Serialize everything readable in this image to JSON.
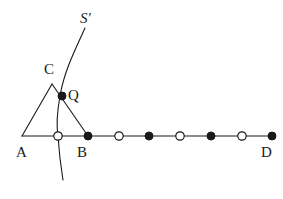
{
  "figure": {
    "type": "geometry-diagram",
    "width": 283,
    "height": 199,
    "background_color": "#ffffff",
    "stroke_color": "#1a1a1a",
    "marker_fill_color": "#1a1a1a",
    "marker_hollow_color": "#ffffff",
    "labels": {
      "A": "A",
      "B": "B",
      "C": "C",
      "D": "D",
      "Q": "Q",
      "S_prime": "S′"
    },
    "label_positions": {
      "A": {
        "x": 16,
        "y": 145
      },
      "B": {
        "x": 77,
        "y": 145
      },
      "C": {
        "x": 44,
        "y": 62
      },
      "D": {
        "x": 261,
        "y": 145
      },
      "Q": {
        "x": 68,
        "y": 88
      },
      "S_prime": {
        "x": 80,
        "y": 11
      }
    },
    "points": {
      "A": {
        "x": 22,
        "y": 136
      },
      "B": {
        "x": 88,
        "y": 136
      },
      "C": {
        "x": 52,
        "y": 84
      },
      "D": {
        "x": 272,
        "y": 136
      },
      "Q": {
        "x": 62,
        "y": 96
      }
    },
    "baseline": {
      "name": "segment-AD",
      "x1": 22,
      "y1": 136,
      "x2": 272,
      "y2": 136
    },
    "triangle": {
      "name": "triangle-ABC",
      "vertices": [
        {
          "x": 22,
          "y": 136
        },
        {
          "x": 52,
          "y": 84
        },
        {
          "x": 88,
          "y": 136
        }
      ],
      "edges": [
        "A-C",
        "C-B",
        "A-B"
      ]
    },
    "curve": {
      "name": "curve-S-prime",
      "path": "M 85,28 C 74,52 64,72 60,96 C 56,118 57,130 58,136 C 59,152 61,168 63,180",
      "top_end": {
        "x": 85,
        "y": 28
      },
      "bottom_end": {
        "x": 63,
        "y": 180
      }
    },
    "markers": [
      {
        "index": 0,
        "x": 58,
        "y": 136,
        "style": "hollow",
        "radius": 4.2,
        "label": ""
      },
      {
        "index": 1,
        "x": 88,
        "y": 136,
        "style": "filled",
        "radius": 4.0,
        "label": "B"
      },
      {
        "index": 2,
        "x": 119,
        "y": 136,
        "style": "hollow",
        "radius": 4.2,
        "label": ""
      },
      {
        "index": 3,
        "x": 149,
        "y": 136,
        "style": "filled",
        "radius": 4.0,
        "label": ""
      },
      {
        "index": 4,
        "x": 180,
        "y": 136,
        "style": "hollow",
        "radius": 4.2,
        "label": ""
      },
      {
        "index": 5,
        "x": 211,
        "y": 136,
        "style": "filled",
        "radius": 4.0,
        "label": ""
      },
      {
        "index": 6,
        "x": 242,
        "y": 136,
        "style": "hollow",
        "radius": 4.2,
        "label": ""
      },
      {
        "index": 7,
        "x": 272,
        "y": 136,
        "style": "filled",
        "radius": 4.0,
        "label": "D"
      }
    ],
    "q_marker": {
      "x": 62,
      "y": 96,
      "style": "filled",
      "radius": 4.0
    }
  }
}
